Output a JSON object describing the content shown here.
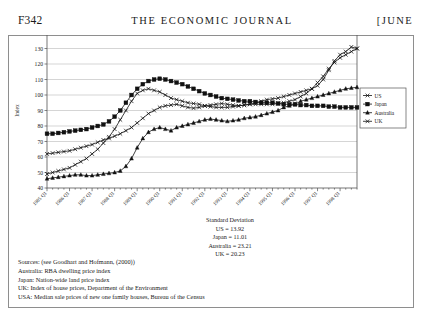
{
  "running_head": {
    "folio": "F342",
    "journal_title": "THE ECONOMIC JOURNAL",
    "month": "[JUNE"
  },
  "chart_data": {
    "type": "line",
    "title": "",
    "xlabel": "",
    "ylabel": "Index",
    "ylim": [
      40,
      140
    ],
    "ytick_step": 10,
    "yticks": [
      40,
      50,
      60,
      70,
      80,
      90,
      100,
      110,
      120,
      130,
      140
    ],
    "grid": true,
    "legend_position": "right",
    "categories": [
      "1985 Q1",
      "1985 Q2",
      "1985 Q3",
      "1985 Q4",
      "1986 Q1",
      "1986 Q2",
      "1986 Q3",
      "1986 Q4",
      "1987 Q1",
      "1987 Q2",
      "1987 Q3",
      "1987 Q4",
      "1988 Q1",
      "1988 Q2",
      "1988 Q3",
      "1988 Q4",
      "1989 Q1",
      "1989 Q2",
      "1989 Q3",
      "1989 Q4",
      "1990 Q1",
      "1990 Q2",
      "1990 Q3",
      "1990 Q4",
      "1991 Q1",
      "1991 Q2",
      "1991 Q3",
      "1991 Q4",
      "1992 Q1",
      "1992 Q2",
      "1992 Q3",
      "1992 Q4",
      "1993 Q1",
      "1993 Q2",
      "1993 Q3",
      "1993 Q4",
      "1994 Q1",
      "1994 Q2",
      "1994 Q3",
      "1994 Q4",
      "1995 Q1",
      "1995 Q2",
      "1995 Q3",
      "1995 Q4",
      "1996 Q1",
      "1996 Q2",
      "1996 Q3",
      "1996 Q4",
      "1997 Q1",
      "1997 Q2",
      "1997 Q3",
      "1997 Q4",
      "1998 Q1",
      "1998 Q2",
      "1998 Q3",
      "1998 Q4"
    ],
    "xtick_labels": [
      "1985 Q1",
      "1986 Q1",
      "1987 Q1",
      "1988 Q1",
      "1989 Q1",
      "1990 Q1",
      "1991 Q1",
      "1992 Q1",
      "1993 Q1",
      "1994 Q1",
      "1995 Q1",
      "1996 Q1",
      "1997 Q1",
      "1998 Q1"
    ],
    "xtick_indices": [
      0,
      4,
      8,
      12,
      16,
      20,
      24,
      28,
      32,
      36,
      40,
      44,
      48,
      52
    ],
    "series": [
      {
        "name": "US",
        "marker": "x",
        "values": [
          62,
          62.5,
          63,
          63.5,
          64,
          65,
          66,
          67,
          68,
          69.5,
          71,
          72,
          73.5,
          75,
          77,
          79,
          82,
          85,
          88,
          90,
          92,
          93,
          93.5,
          94,
          93,
          92,
          91.5,
          92,
          93,
          93.5,
          94,
          94.5,
          94,
          93.5,
          93,
          93.5,
          94,
          95,
          96,
          97,
          97.5,
          98,
          99,
          100,
          101,
          102,
          103,
          104,
          106,
          110,
          116,
          122,
          126,
          128,
          131,
          130
        ]
      },
      {
        "name": "Japan",
        "marker": "square",
        "values": [
          75,
          75,
          75.5,
          76,
          76.5,
          77,
          77.5,
          78,
          79,
          80,
          81,
          83,
          86,
          90,
          95,
          100,
          104,
          107,
          109,
          110,
          110.5,
          110,
          109,
          108,
          107,
          105.5,
          104,
          102.5,
          101,
          100,
          99,
          98,
          97.5,
          97,
          96.5,
          96,
          96,
          95.5,
          95,
          95,
          95,
          94.5,
          94,
          94,
          94,
          93.5,
          93.5,
          93,
          93,
          93,
          92.5,
          92.5,
          92,
          92,
          92,
          92
        ]
      },
      {
        "name": "Australia",
        "marker": "triangle",
        "values": [
          46,
          46.5,
          47,
          47.5,
          48,
          48.5,
          48.5,
          48,
          48,
          48.5,
          49,
          49.5,
          50,
          51,
          54,
          59,
          66,
          72,
          76,
          78,
          79,
          78,
          77,
          79,
          80,
          81,
          82,
          83,
          84,
          84.5,
          84,
          83.5,
          83,
          83.5,
          84,
          85,
          85.5,
          86,
          87,
          88,
          89,
          90,
          92,
          93,
          94,
          96,
          97,
          98,
          99,
          100,
          101,
          102,
          103,
          104,
          104.5,
          105
        ]
      },
      {
        "name": "UK",
        "marker": "x",
        "values": [
          49,
          50,
          51,
          52,
          53,
          55,
          57,
          59,
          62,
          65,
          69,
          73,
          78,
          84,
          90,
          96,
          101,
          103,
          104,
          103,
          102,
          100,
          98,
          97,
          96,
          95,
          94.5,
          94,
          93,
          92.5,
          92,
          92,
          92,
          92.5,
          93,
          93.5,
          94,
          94,
          94,
          94,
          94,
          94.5,
          95,
          96,
          97,
          99,
          101,
          104,
          108,
          112,
          117,
          121,
          124,
          126,
          128,
          130
        ]
      }
    ]
  },
  "standard_deviation": {
    "title": "Standard Deviation",
    "rows": [
      "US = 13.92",
      "Japan = 11.01",
      "Australia = 23.21",
      "UK = 20.23"
    ]
  },
  "sources": {
    "lines": [
      "Sources: (see Goodhart and Hofmann, (2000))",
      "Australia: RBA dwelling price index",
      "Japan: Nation-wide land price index",
      "UK: Index of house prices, Department of the Environment",
      "USA: Median sale prices of new one family houses,  Bureau of the Census"
    ]
  }
}
